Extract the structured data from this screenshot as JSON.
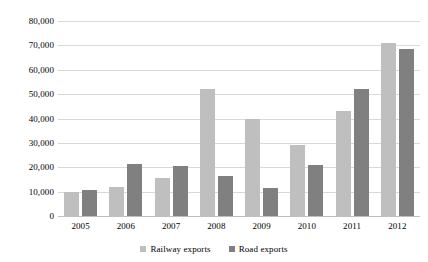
{
  "chart_data": {
    "type": "bar",
    "title": "",
    "subtitle": "",
    "xlabel": "",
    "ylabel": "",
    "categories": [
      "2005",
      "2006",
      "2007",
      "2008",
      "2009",
      "2010",
      "2011",
      "2012"
    ],
    "series": [
      {
        "name": "Railway exports",
        "color": "#bfbfbf",
        "values": [
          9800,
          12000,
          15500,
          52000,
          40000,
          29000,
          43000,
          71000
        ]
      },
      {
        "name": "Road exports",
        "color": "#808080",
        "values": [
          10500,
          21500,
          20500,
          16500,
          11500,
          21000,
          52000,
          68500
        ]
      }
    ],
    "ylim": [
      0,
      80000
    ],
    "ytick_step": 10000,
    "ytick_labels": [
      "80,000",
      "70,000",
      "60,000",
      "50,000",
      "40,000",
      "30,000",
      "20,000",
      "10,000",
      "0"
    ],
    "ytick_values": [
      80000,
      70000,
      60000,
      50000,
      40000,
      30000,
      20000,
      10000,
      0
    ],
    "grid": true,
    "grid_color": "#d9d9d9",
    "legend_position": "bottom"
  }
}
